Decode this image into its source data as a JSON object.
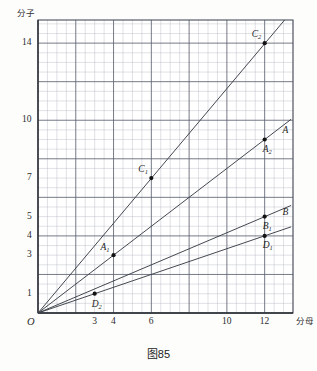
{
  "caption": "图85",
  "axes": {
    "y_title": "分子",
    "x_title": "分母",
    "origin_label": "O"
  },
  "chart_data": {
    "type": "line",
    "title": "图85",
    "xlabel": "分母",
    "ylabel": "分子",
    "xlim": [
      0,
      13.5
    ],
    "ylim": [
      0,
      15.2
    ],
    "grid": true,
    "grid_minor_step": 0.5,
    "grid_major_step": 2,
    "legend": "none",
    "x_ticks": [
      "3",
      "4",
      "6",
      "10",
      "12"
    ],
    "x_tick_values": [
      3,
      4,
      6,
      10,
      12
    ],
    "y_ticks": [
      "1",
      "3",
      "4",
      "5",
      "7",
      "10",
      "14"
    ],
    "y_tick_values": [
      1,
      3,
      4,
      5,
      7,
      10,
      14
    ],
    "series": [
      {
        "name": "C",
        "slope_label": "7/6",
        "from": [
          0,
          0
        ],
        "to": [
          13.4,
          15.6
        ],
        "points": [
          {
            "label": "C",
            "sub": "1",
            "x": 6,
            "y": 7,
            "label_dx": -13,
            "label_dy": -13
          },
          {
            "label": "C",
            "sub": "2",
            "x": 12,
            "y": 14,
            "label_dx": -13,
            "label_dy": -13
          }
        ]
      },
      {
        "name": "A",
        "slope_label": "3/4",
        "from": [
          0,
          0
        ],
        "to": [
          13.4,
          10.05
        ],
        "points": [
          {
            "label": "A",
            "sub": "1",
            "x": 4,
            "y": 3,
            "label_dx": -13,
            "label_dy": -12
          },
          {
            "label": "A",
            "sub": "2",
            "x": 12,
            "y": 9,
            "label_dx": -2,
            "label_dy": 5
          }
        ],
        "end_label": {
          "label": "A",
          "sub": "",
          "x": 12.95,
          "y": 9.7
        }
      },
      {
        "name": "B",
        "slope_label": "5/12",
        "from": [
          0,
          0
        ],
        "to": [
          13.4,
          5.58
        ],
        "points": [
          {
            "label": "B",
            "sub": "1",
            "x": 12,
            "y": 5,
            "label_dx": -2,
            "label_dy": 5
          }
        ],
        "end_label": {
          "label": "B",
          "sub": "",
          "x": 12.95,
          "y": 5.45
        }
      },
      {
        "name": "D",
        "slope_label": "1/3",
        "from": [
          0,
          0
        ],
        "to": [
          13.4,
          4.47
        ],
        "points": [
          {
            "label": "D",
            "sub": "2",
            "x": 3,
            "y": 1,
            "label_dx": -3,
            "label_dy": 6
          },
          {
            "label": "D",
            "sub": "1",
            "x": 12,
            "y": 4,
            "label_dx": -2,
            "label_dy": 5
          }
        ]
      }
    ]
  }
}
